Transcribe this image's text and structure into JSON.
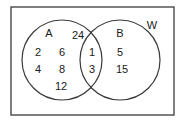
{
  "diagram": {
    "type": "venn",
    "universal_label": "W",
    "sets": [
      {
        "label": "A",
        "only": [
          "2",
          "6",
          "4",
          "8",
          "12",
          "24"
        ]
      },
      {
        "label": "B",
        "only": [
          "5",
          "15"
        ]
      }
    ],
    "intersection": [
      "1",
      "3"
    ],
    "colors": {
      "stroke": "#3a3a3a",
      "text": "#1a1a1a",
      "background": "#ffffff"
    }
  },
  "labels": {
    "set_a": "A",
    "set_b": "B",
    "universe": "W",
    "a_only": [
      "24",
      "2",
      "6",
      "4",
      "8",
      "12"
    ],
    "both": [
      "1",
      "3"
    ],
    "b_only": [
      "5",
      "15"
    ]
  }
}
